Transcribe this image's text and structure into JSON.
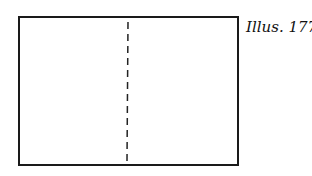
{
  "illustration": {
    "label": "Illus. 177",
    "shape": "rectangle",
    "fold_line": "vertical-dashed-center",
    "stroke_color": "#1a1a1a"
  }
}
